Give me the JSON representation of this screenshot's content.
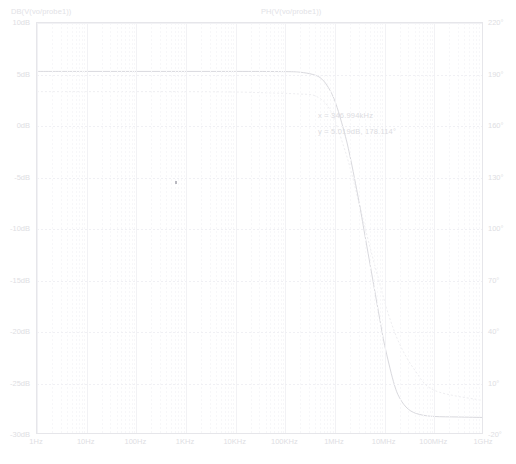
{
  "traces": {
    "magnitude_label": "DB(V(vo/probe1))",
    "phase_label": "PH(V(vo/probe1))"
  },
  "readout": {
    "line1": "x = 346.994kHz",
    "line2": "y = 5.019dB, 178.114°"
  },
  "colors": {
    "magnitude_trace": "#d9d9de",
    "phase_trace": "#eeeef1",
    "grid": "#f1f1f5",
    "frame": "#e6e6ea",
    "text": "#dedee3",
    "background": "#ffffff"
  },
  "chart_data": {
    "type": "line",
    "title": "",
    "xlabel": "",
    "ylabel": "",
    "xscale": "log",
    "xlim": [
      1,
      1000000000
    ],
    "grid": true,
    "legend": "top",
    "xtick_labels": [
      "1Hz",
      "10Hz",
      "100Hz",
      "1KHz",
      "10KHz",
      "100KHz",
      "1MHz",
      "10MHz",
      "100MHz",
      "1GHz"
    ],
    "xtick_values": [
      1,
      10,
      100,
      1000,
      10000,
      100000,
      1000000,
      10000000,
      100000000,
      1000000000
    ],
    "axes": [
      {
        "side": "left",
        "unit": "dB",
        "ylim": [
          -30,
          10
        ],
        "tick_labels": [
          "10dB",
          "5dB",
          "0dB",
          "-5dB",
          "-10dB",
          "-15dB",
          "-20dB",
          "-25dB",
          "-30dB"
        ],
        "tick_values": [
          10,
          5,
          0,
          -5,
          -10,
          -15,
          -20,
          -25,
          -30
        ]
      },
      {
        "side": "right",
        "unit": "°",
        "ylim": [
          -20,
          220
        ],
        "tick_labels": [
          "220°",
          "190°",
          "160°",
          "130°",
          "100°",
          "70°",
          "40°",
          "10°",
          "-20°"
        ],
        "tick_values": [
          220,
          190,
          160,
          130,
          100,
          70,
          40,
          10,
          -20
        ]
      }
    ],
    "series": [
      {
        "name": "DB(V(vo/probe1))",
        "axis": "left",
        "style": "solid",
        "color": "#d9d9de",
        "x": [
          1,
          10,
          100,
          1000,
          10000,
          100000,
          200000,
          346994,
          500000,
          700000,
          1000000,
          1500000,
          2000000,
          3000000,
          4000000,
          6000000,
          8000000,
          10000000,
          15000000,
          20000000,
          30000000,
          50000000,
          100000000,
          300000000,
          1000000000
        ],
        "y": [
          5.3,
          5.3,
          5.3,
          5.3,
          5.3,
          5.28,
          5.22,
          5.019,
          4.7,
          3.9,
          2.4,
          -0.4,
          -2.9,
          -7.2,
          -10.6,
          -15.4,
          -18.8,
          -21.3,
          -24.8,
          -26.4,
          -27.5,
          -28.0,
          -28.2,
          -28.25,
          -28.3
        ]
      },
      {
        "name": "PH(V(vo/probe1))",
        "axis": "right",
        "style": "dotted",
        "color": "#eeeef1",
        "x": [
          1,
          10,
          100,
          1000,
          10000,
          100000,
          200000,
          346994,
          500000,
          700000,
          1000000,
          1500000,
          2000000,
          3000000,
          5000000,
          8000000,
          12000000,
          20000000,
          40000000,
          100000000,
          1000000000
        ],
        "y": [
          180,
          180,
          180,
          180,
          179.8,
          179,
          178.6,
          178.114,
          176,
          172,
          163,
          148,
          136,
          116,
          90,
          68,
          50,
          33,
          18,
          6,
          0
        ]
      }
    ],
    "annotations": [
      {
        "text": "x = 346.994kHz",
        "x": 346994,
        "y": 5.019
      },
      {
        "text": "y = 5.019dB, 178.114°",
        "x": 346994,
        "y": 5.019
      }
    ]
  }
}
